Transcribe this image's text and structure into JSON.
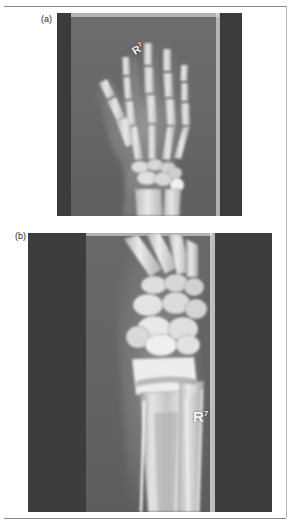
{
  "figure": {
    "type": "radiograph-figure",
    "panel_count": 2,
    "background_color": "#ffffff",
    "border_color": "#8a8a8a"
  },
  "panels": [
    {
      "letter": "(a)",
      "name": "panel-a",
      "description": "Posteroanterior (PA) radiograph of right hand and wrist",
      "marker_letter": "R",
      "marker_superscript": "7",
      "film_background": "#4a4a4a",
      "collimated_field_color": "#6d6d6d",
      "bands": [
        {
          "name": "left-dark-band",
          "color": "#3b3b3b"
        },
        {
          "name": "collimated-field",
          "color": "#6d6d6d"
        },
        {
          "name": "bright-edge",
          "color": "#cfcfcf"
        },
        {
          "name": "right-dark-band",
          "color": "#3b3b3b"
        }
      ]
    },
    {
      "letter": "(b)",
      "name": "panel-b",
      "description": "Lateral oblique radiograph of right distal forearm and wrist",
      "marker_letter": "R",
      "marker_superscript": "7",
      "film_background": "#474747",
      "collimated_field_color": "#686868",
      "bands": [
        {
          "name": "left-dark-band",
          "color": "#3d3d3d"
        },
        {
          "name": "collimated-field",
          "color": "#686868"
        },
        {
          "name": "bright-edge",
          "color": "#d8d8d8"
        },
        {
          "name": "right-dark-band",
          "color": "#3d3d3d"
        }
      ]
    }
  ]
}
